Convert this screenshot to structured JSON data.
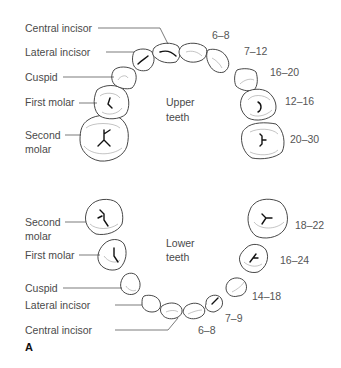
{
  "figure": {
    "panel_label": "A",
    "upper": {
      "title_line1": "Upper",
      "title_line2": "teeth",
      "labels": {
        "central_incisor": "Central incisor",
        "lateral_incisor": "Lateral incisor",
        "cuspid": "Cuspid",
        "first_molar": "First molar",
        "second_molar_line1": "Second",
        "second_molar_line2": "molar"
      },
      "eruption_months": {
        "central_incisor": "6–8",
        "lateral_incisor": "7–12",
        "cuspid": "16–20",
        "first_molar": "12–16",
        "second_molar": "20–30"
      }
    },
    "lower": {
      "title_line1": "Lower",
      "title_line2": "teeth",
      "labels": {
        "second_molar_line1": "Second",
        "second_molar_line2": "molar",
        "first_molar": "First molar",
        "cuspid": "Cuspid",
        "lateral_incisor": "Lateral incisor",
        "central_incisor": "Central incisor"
      },
      "eruption_months": {
        "second_molar": "18–22",
        "first_molar": "16–24",
        "cuspid": "14–18",
        "lateral_incisor": "7–9",
        "central_incisor": "6–8"
      }
    }
  }
}
